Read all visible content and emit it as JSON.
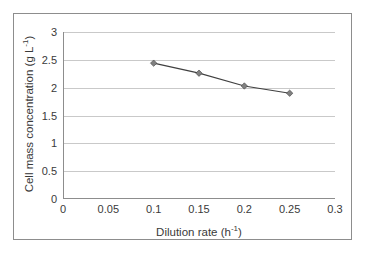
{
  "chart_data": {
    "type": "line",
    "title": "",
    "xlabel": "Dilution rate (h-1)",
    "xlabel_base": "Dilution rate (h",
    "xlabel_sup": "-1",
    "xlabel_close": ")",
    "ylabel": "Cell mass concentration (g L-1)",
    "ylabel_base": "Cell mass concentration (g L",
    "ylabel_sup": "-1",
    "ylabel_close": ")",
    "x": [
      0.1,
      0.15,
      0.2,
      0.25
    ],
    "values": [
      2.44,
      2.26,
      2.03,
      1.9
    ],
    "series": [
      {
        "name": "Cell mass concentration",
        "x": [
          0.1,
          0.15,
          0.2,
          0.25
        ],
        "values": [
          2.44,
          2.26,
          2.03,
          1.9
        ]
      }
    ],
    "xlim": [
      0,
      0.3
    ],
    "ylim": [
      0,
      3
    ],
    "xticks": [
      0,
      0.05,
      0.1,
      0.15,
      0.2,
      0.25,
      0.3
    ],
    "xtick_labels": [
      "0",
      "0.05",
      "0.1",
      "0.15",
      "0.2",
      "0.25",
      "0.3"
    ],
    "yticks": [
      0,
      0.5,
      1,
      1.5,
      2,
      2.5,
      3
    ],
    "ytick_labels": [
      "0",
      "0.5",
      "1",
      "1.5",
      "2",
      "2.5",
      "3"
    ],
    "grid": "horizontal",
    "legend": "none",
    "marker": "diamond",
    "marker_color": "#808080",
    "line_color": "#404040",
    "gridline_color": "#c9c9c9",
    "axis_color": "#8d8d8d",
    "background_color": "#ffffff",
    "text_color": "#3a3a3a"
  }
}
